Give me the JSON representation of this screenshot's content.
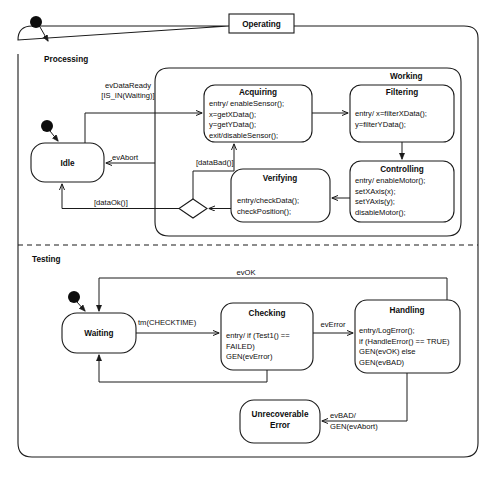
{
  "diagram": {
    "kind": "uml-statechart",
    "title": "Operating",
    "colors": {
      "stroke": "#1a1a1a",
      "fill": "#ffffff",
      "dot": "#0d0d0d"
    },
    "regions": [
      {
        "id": "processing",
        "label": "Processing"
      },
      {
        "id": "testing",
        "label": "Testing"
      }
    ],
    "composites": [
      {
        "id": "working",
        "label": "Working"
      }
    ],
    "states": [
      {
        "id": "idle",
        "name": "Idle",
        "body": []
      },
      {
        "id": "acquiring",
        "name": "Acquiring",
        "body": [
          "entry/ enableSensor();",
          "x=getXData();",
          "y=getYData();",
          "exit/disableSensor();"
        ]
      },
      {
        "id": "filtering",
        "name": "Filtering",
        "body": [
          "entry/ x=filterXData();",
          "y=filterYData();"
        ]
      },
      {
        "id": "controlling",
        "name": "Controlling",
        "body": [
          "entry/ enableMotor();",
          "setXAxis(x);",
          "setYAxis(y);",
          "disableMotor();"
        ]
      },
      {
        "id": "verifying",
        "name": "Verifying",
        "body": [
          "entry/checkData();",
          "checkPosition();"
        ]
      },
      {
        "id": "waiting",
        "name": "Waiting",
        "body": []
      },
      {
        "id": "checking",
        "name": "Checking",
        "body": [
          "entry/ if (Test1() ==",
          "FAILED)",
          "GEN(evError)"
        ]
      },
      {
        "id": "handling",
        "name": "Handling",
        "body": [
          "entry/LogError();",
          "if (HandleError() == TRUE)",
          "GEN(evOK) else",
          "GEN(evBAD)"
        ]
      },
      {
        "id": "unrecoverable",
        "name": "Unrecoverable",
        "name2": "Error",
        "body": []
      }
    ],
    "transitions": [
      {
        "id": "t-dataready",
        "label1": "evDataReady",
        "label2": "[IS_IN(Waiting)]",
        "from": "idle",
        "to": "acquiring"
      },
      {
        "id": "t-abort",
        "label1": "evAbort",
        "from": "working",
        "to": "idle"
      },
      {
        "id": "t-databad",
        "label1": "[dataBad()]",
        "from": "choice",
        "to": "acquiring"
      },
      {
        "id": "t-dataok",
        "label1": "[dataOk()]",
        "from": "choice",
        "to": "idle"
      },
      {
        "id": "t-checktime",
        "label1": "tm(CHECKTIME)",
        "from": "waiting",
        "to": "checking"
      },
      {
        "id": "t-everror",
        "label1": "evError",
        "from": "checking",
        "to": "handling"
      },
      {
        "id": "t-evok",
        "label1": "evOK",
        "from": "handling",
        "to": "waiting"
      },
      {
        "id": "t-evbad",
        "label1": "evBAD/",
        "label2": "GEN(evAbort)",
        "from": "handling",
        "to": "unrecoverable"
      }
    ],
    "pseudostates": [
      {
        "id": "initial-operating",
        "kind": "initial-dot"
      },
      {
        "id": "initial-processing",
        "kind": "initial-dot"
      },
      {
        "id": "initial-testing",
        "kind": "initial-dot"
      },
      {
        "id": "choice-verify",
        "kind": "choice-diamond"
      }
    ]
  }
}
